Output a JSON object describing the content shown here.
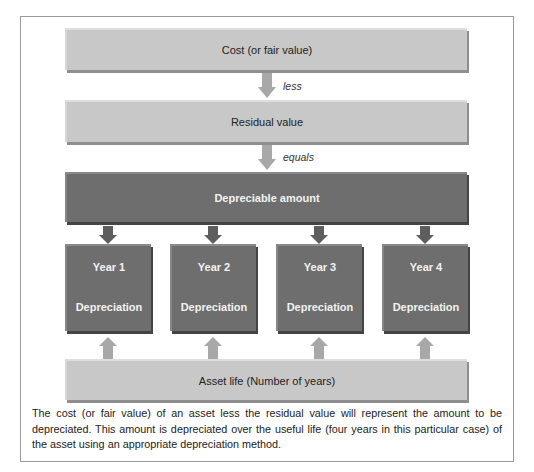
{
  "diagram": {
    "top_boxes": {
      "cost": "Cost (or fair value)",
      "less": "less",
      "residual": "Residual value",
      "equals": "equals",
      "depreciable": "Depreciable amount"
    },
    "years": [
      {
        "title": "Year 1",
        "label": "Depreciation"
      },
      {
        "title": "Year 2",
        "label": "Depreciation"
      },
      {
        "title": "Year 3",
        "label": "Depreciation"
      },
      {
        "title": "Year 4",
        "label": "Depreciation"
      }
    ],
    "asset_life": "Asset life (Number of years)"
  },
  "caption": "The cost (or fair value) of an asset less the residual value will represent the amount to be depreciated. This amount is depreciated over the useful life (four years in this particular case) of the asset using an appropriate depreciation method.",
  "colors": {
    "light_box": "#c8c8c8",
    "dark_box": "#6e6e6e",
    "light_arrow": "#a8a8a8",
    "dark_arrow": "#5e5e5e"
  }
}
